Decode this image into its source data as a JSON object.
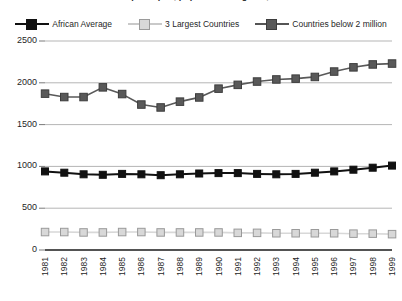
{
  "chart_data": {
    "type": "line",
    "title": "Real GDP per capita, population weighted, 1981-1999",
    "xlabel": "",
    "ylabel": "",
    "grid": true,
    "legend_position": "top",
    "ylim": [
      0,
      2500
    ],
    "yticks": [
      0,
      500,
      1000,
      1500,
      2000,
      2500
    ],
    "categories": [
      "1981",
      "1982",
      "1983",
      "1984",
      "1985",
      "1986",
      "1987",
      "1988",
      "1989",
      "1990",
      "1991",
      "1992",
      "1993",
      "1994",
      "1995",
      "1996",
      "1997",
      "1998",
      "1999"
    ],
    "series": [
      {
        "name": "African Average",
        "color": "#111111",
        "marker": "square",
        "values": [
          940,
          925,
          905,
          900,
          910,
          905,
          895,
          905,
          915,
          920,
          920,
          910,
          905,
          910,
          925,
          940,
          960,
          985,
          1010
        ]
      },
      {
        "name": "3 Largest Countries",
        "color": "#d8d8d8",
        "marker": "square",
        "values": [
          215,
          215,
          210,
          210,
          215,
          215,
          210,
          210,
          210,
          210,
          205,
          205,
          200,
          200,
          200,
          200,
          195,
          195,
          190
        ]
      },
      {
        "name": "Countries below 2 million",
        "color": "#595959",
        "marker": "square",
        "values": [
          1870,
          1830,
          1830,
          1945,
          1865,
          1740,
          1705,
          1775,
          1825,
          1930,
          1975,
          2015,
          2040,
          2050,
          2070,
          2135,
          2185,
          2220,
          2230
        ]
      }
    ]
  }
}
